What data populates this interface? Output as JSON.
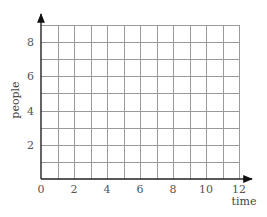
{
  "chart_data": {
    "type": "line",
    "title": "",
    "xlabel": "time",
    "ylabel": "people",
    "xlim": [
      0,
      12
    ],
    "ylim": [
      0,
      9
    ],
    "x_ticks": [
      0,
      2,
      4,
      6,
      8,
      10,
      12
    ],
    "y_ticks": [
      2,
      4,
      6,
      8
    ],
    "x_tick_labels": [
      "0",
      "2",
      "4",
      "6",
      "8",
      "10",
      "12"
    ],
    "y_tick_labels": [
      "2",
      "4",
      "6",
      "8"
    ],
    "grid": true,
    "grid_x_step": 1,
    "grid_y_step": 1,
    "series": [],
    "legend": null
  },
  "colors": {
    "grid": "#9a9a9a",
    "axis": "#222222",
    "text": "#555555"
  }
}
